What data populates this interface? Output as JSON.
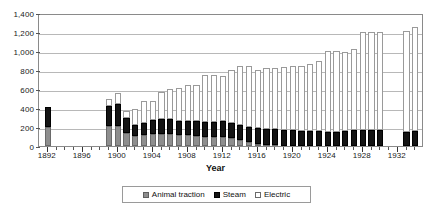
{
  "chart_data": {
    "type": "bar",
    "stacked": true,
    "title": "",
    "xlabel": "Year",
    "ylabel": "",
    "ylim": [
      0,
      1400
    ],
    "ytick_step": 200,
    "ytick_labels": [
      "0",
      "200",
      "400",
      "600",
      "800",
      "1,000",
      "1,200",
      "1,400"
    ],
    "xlim": [
      1891,
      1935
    ],
    "xtick_labels": [
      "1892",
      "1896",
      "1900",
      "1904",
      "1908",
      "1912",
      "1916",
      "1920",
      "1924",
      "1928",
      "1932"
    ],
    "grid": "horizontal",
    "legend_position": "bottom",
    "colors": {
      "animal_traction": "#8e8e8e",
      "steam": "#141414",
      "electric": "#ffffff",
      "gridline": "#b8b8b8",
      "axis": "#8a8a8a"
    },
    "categories": [
      1892,
      1893,
      1894,
      1895,
      1896,
      1897,
      1898,
      1899,
      1900,
      1901,
      1902,
      1903,
      1904,
      1905,
      1906,
      1907,
      1908,
      1909,
      1910,
      1911,
      1912,
      1913,
      1914,
      1915,
      1916,
      1917,
      1918,
      1919,
      1920,
      1921,
      1922,
      1923,
      1924,
      1925,
      1926,
      1927,
      1928,
      1929,
      1930,
      1931,
      1932,
      1933,
      1934
    ],
    "series": [
      {
        "name": "Animal traction",
        "values": [
          200,
          null,
          null,
          null,
          null,
          null,
          null,
          210,
          215,
          140,
          110,
          120,
          130,
          130,
          130,
          120,
          115,
          110,
          100,
          95,
          90,
          80,
          60,
          40,
          25,
          15,
          10,
          5,
          0,
          0,
          0,
          0,
          0,
          0,
          0,
          0,
          0,
          0,
          0,
          null,
          null,
          0,
          0
        ]
      },
      {
        "name": "Steam",
        "values": [
          215,
          null,
          null,
          null,
          null,
          null,
          null,
          215,
          230,
          155,
          115,
          125,
          140,
          150,
          150,
          140,
          145,
          150,
          155,
          160,
          175,
          160,
          160,
          160,
          165,
          165,
          165,
          165,
          165,
          160,
          160,
          160,
          145,
          150,
          160,
          165,
          165,
          165,
          165,
          null,
          null,
          150,
          155
        ]
      },
      {
        "name": "Electric",
        "values": [
          0,
          null,
          null,
          null,
          null,
          null,
          null,
          75,
          115,
          75,
          165,
          225,
          205,
          290,
          325,
          350,
          380,
          380,
          490,
          490,
          475,
          560,
          620,
          640,
          615,
          640,
          650,
          665,
          680,
          680,
          700,
          740,
          855,
          850,
          835,
          855,
          1035,
          1035,
          1035,
          null,
          null,
          1060,
          1095
        ]
      }
    ]
  },
  "legend": {
    "items": [
      {
        "label": "Animal traction",
        "swatch": "animal"
      },
      {
        "label": "Steam",
        "swatch": "steam"
      },
      {
        "label": "Electric",
        "swatch": "electric"
      }
    ]
  }
}
